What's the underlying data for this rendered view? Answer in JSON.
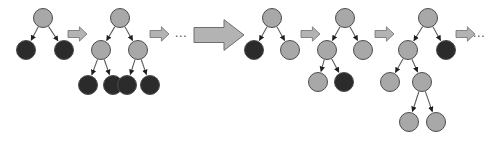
{
  "figure": {
    "background_color": "#ffffff",
    "width": 490,
    "height": 146
  },
  "legend": {
    "gray_node_color": "#a8a8a8",
    "dark_node_color": "#2b2b2b",
    "node_stroke_color": "#4d4d4d",
    "edge_color": "#5a5a5a",
    "arrow_fill_color": "#b3b3b3",
    "arrow_stroke_color": "#6e6e6e",
    "ellipsis_color": "#555555",
    "node_radius": 9.5,
    "gray_node_label": "gray node",
    "dark_node_label": "dark node"
  },
  "ellipses": [
    {
      "id": "ellipsis-middle",
      "text": "…",
      "x": 181,
      "y": 34
    },
    {
      "id": "ellipsis-right",
      "text": "…",
      "x": 479,
      "y": 34
    }
  ],
  "arrows": [
    {
      "id": "arrow-step-1",
      "size": "small",
      "x": 68,
      "y": 34,
      "length": 19,
      "thickness": 7
    },
    {
      "id": "arrow-step-2",
      "size": "small",
      "x": 150,
      "y": 34,
      "length": 19,
      "thickness": 7
    },
    {
      "id": "arrow-step-big",
      "size": "large",
      "x": 194,
      "y": 35,
      "length": 50,
      "thickness": 15
    },
    {
      "id": "arrow-step-3",
      "size": "small",
      "x": 301,
      "y": 34,
      "length": 19,
      "thickness": 7
    },
    {
      "id": "arrow-step-4",
      "size": "small",
      "x": 375,
      "y": 34,
      "length": 19,
      "thickness": 7
    },
    {
      "id": "arrow-step-5",
      "size": "small",
      "x": 456,
      "y": 34,
      "length": 19,
      "thickness": 7
    }
  ],
  "trees": [
    {
      "id": "tree-1",
      "name": "tree-step-1",
      "nodes": [
        {
          "id": "t1-root",
          "label": "root",
          "fill": "gray",
          "x": 43,
          "y": 18
        },
        {
          "id": "t1-l",
          "label": "left child",
          "fill": "dark",
          "x": 26,
          "y": 50
        },
        {
          "id": "t1-r",
          "label": "right child",
          "fill": "dark",
          "x": 64,
          "y": 50
        }
      ],
      "edges": [
        {
          "from": "t1-root",
          "to": "t1-l"
        },
        {
          "from": "t1-root",
          "to": "t1-r"
        }
      ]
    },
    {
      "id": "tree-2",
      "name": "tree-step-2",
      "nodes": [
        {
          "id": "t2-root",
          "label": "root",
          "fill": "gray",
          "x": 120,
          "y": 18
        },
        {
          "id": "t2-l",
          "label": "left child",
          "fill": "gray",
          "x": 101,
          "y": 50
        },
        {
          "id": "t2-r",
          "label": "right child",
          "fill": "gray",
          "x": 138,
          "y": 50
        },
        {
          "id": "t2-ll",
          "label": "leaf 1",
          "fill": "dark",
          "x": 88,
          "y": 85
        },
        {
          "id": "t2-lr",
          "label": "leaf 2",
          "fill": "dark",
          "x": 113,
          "y": 85
        },
        {
          "id": "t2-rl",
          "label": "leaf 3",
          "fill": "dark",
          "x": 127,
          "y": 85
        },
        {
          "id": "t2-rr",
          "label": "leaf 4",
          "fill": "dark",
          "x": 150,
          "y": 85
        }
      ],
      "edges": [
        {
          "from": "t2-root",
          "to": "t2-l"
        },
        {
          "from": "t2-root",
          "to": "t2-r"
        },
        {
          "from": "t2-l",
          "to": "t2-ll"
        },
        {
          "from": "t2-l",
          "to": "t2-lr"
        },
        {
          "from": "t2-r",
          "to": "t2-rl"
        },
        {
          "from": "t2-r",
          "to": "t2-rr"
        }
      ]
    },
    {
      "id": "tree-3",
      "name": "tree-step-3",
      "nodes": [
        {
          "id": "t3-root",
          "label": "root",
          "fill": "gray",
          "x": 272,
          "y": 18
        },
        {
          "id": "t3-l",
          "label": "left child",
          "fill": "dark",
          "x": 254,
          "y": 50
        },
        {
          "id": "t3-r",
          "label": "right child",
          "fill": "gray",
          "x": 290,
          "y": 50
        }
      ],
      "edges": [
        {
          "from": "t3-root",
          "to": "t3-l"
        },
        {
          "from": "t3-root",
          "to": "t3-r"
        }
      ]
    },
    {
      "id": "tree-4",
      "name": "tree-step-4",
      "nodes": [
        {
          "id": "t4-root",
          "label": "root",
          "fill": "gray",
          "x": 345,
          "y": 18
        },
        {
          "id": "t4-l",
          "label": "left child",
          "fill": "gray",
          "x": 327,
          "y": 50
        },
        {
          "id": "t4-r",
          "label": "right child",
          "fill": "gray",
          "x": 363,
          "y": 50
        },
        {
          "id": "t4-ll",
          "label": "leaf 1",
          "fill": "gray",
          "x": 318,
          "y": 82
        },
        {
          "id": "t4-lr",
          "label": "leaf 2",
          "fill": "dark",
          "x": 344,
          "y": 82
        }
      ],
      "edges": [
        {
          "from": "t4-root",
          "to": "t4-l"
        },
        {
          "from": "t4-root",
          "to": "t4-r"
        },
        {
          "from": "t4-l",
          "to": "t4-ll"
        },
        {
          "from": "t4-l",
          "to": "t4-lr"
        }
      ]
    },
    {
      "id": "tree-5",
      "name": "tree-step-5",
      "nodes": [
        {
          "id": "t5-root",
          "label": "root",
          "fill": "gray",
          "x": 428,
          "y": 18
        },
        {
          "id": "t5-l",
          "label": "left child",
          "fill": "gray",
          "x": 408,
          "y": 50
        },
        {
          "id": "t5-r",
          "label": "right child",
          "fill": "dark",
          "x": 446,
          "y": 50
        },
        {
          "id": "t5-ll",
          "label": "grandchild 1",
          "fill": "gray",
          "x": 390,
          "y": 82
        },
        {
          "id": "t5-lr",
          "label": "grandchild 2",
          "fill": "gray",
          "x": 422,
          "y": 82
        },
        {
          "id": "t5-lrl",
          "label": "great-grandchild 1",
          "fill": "gray",
          "x": 409,
          "y": 122
        },
        {
          "id": "t5-lrr",
          "label": "great-grandchild 2",
          "fill": "gray",
          "x": 436,
          "y": 122
        }
      ],
      "edges": [
        {
          "from": "t5-root",
          "to": "t5-l"
        },
        {
          "from": "t5-root",
          "to": "t5-r"
        },
        {
          "from": "t5-l",
          "to": "t5-ll"
        },
        {
          "from": "t5-l",
          "to": "t5-lr"
        },
        {
          "from": "t5-lr",
          "to": "t5-lrl"
        },
        {
          "from": "t5-lr",
          "to": "t5-lrr"
        }
      ]
    }
  ]
}
